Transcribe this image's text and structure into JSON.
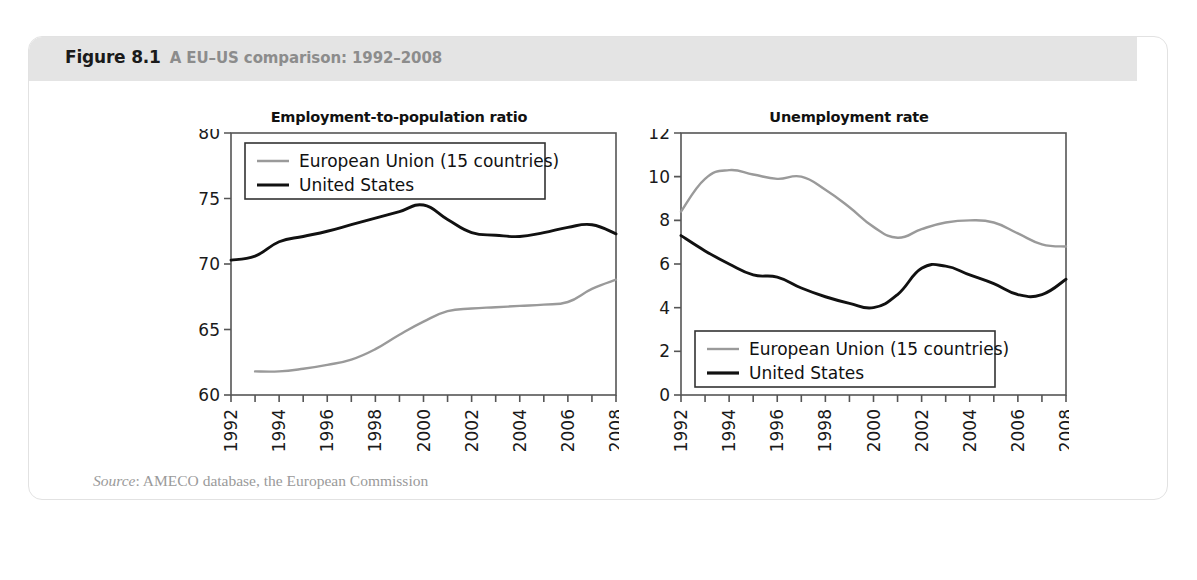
{
  "figure": {
    "number": "Figure 8.1",
    "title": "A EU–US comparison: 1992–2008",
    "source_prefix": "Source",
    "source_text": ": AMECO database, the European Commission"
  },
  "colors": {
    "eu_line": "#9a9a9a",
    "us_line": "#111111",
    "header_band": "#e4e4e4",
    "card_border": "#e2e2e2",
    "caption_gray": "#8c8c8c",
    "axis": "#555555",
    "source_gray": "#9a9a9a"
  },
  "legend": {
    "eu_label": "European Union (15 countries)",
    "us_label": "United States"
  },
  "chart_data": [
    {
      "type": "line",
      "title": "Employment-to-population ratio",
      "xlabel": "",
      "ylabel": "",
      "xlim": [
        1992,
        2008
      ],
      "ylim": [
        60,
        80
      ],
      "yticks": [
        60,
        65,
        70,
        75,
        80
      ],
      "ytick_labels": [
        "60",
        "65",
        "70",
        "75",
        "80"
      ],
      "x": [
        1992,
        1993,
        1994,
        1995,
        1996,
        1997,
        1998,
        1999,
        2000,
        2001,
        2002,
        2003,
        2004,
        2005,
        2006,
        2007,
        2008
      ],
      "xtick_labels": [
        "1992",
        "",
        "1994",
        "",
        "1996",
        "",
        "1998",
        "",
        "2000",
        "",
        "2002",
        "",
        "2004",
        "",
        "2006",
        "",
        "2008"
      ],
      "grid": false,
      "legend_position": "top-left",
      "series": [
        {
          "name": "European Union (15 countries)",
          "color": "#9a9a9a",
          "x": [
            1993,
            1994,
            1995,
            1996,
            1997,
            1998,
            1999,
            2000,
            2001,
            2002,
            2003,
            2004,
            2005,
            2006,
            2007,
            2008
          ],
          "values": [
            61.8,
            61.8,
            62.0,
            62.3,
            62.7,
            63.5,
            64.6,
            65.6,
            66.4,
            66.6,
            66.7,
            66.8,
            66.9,
            67.1,
            68.1,
            68.8
          ]
        },
        {
          "name": "United States",
          "color": "#111111",
          "x": [
            1992,
            1993,
            1994,
            1995,
            1996,
            1997,
            1998,
            1999,
            2000,
            2001,
            2002,
            2003,
            2004,
            2005,
            2006,
            2007,
            2008
          ],
          "values": [
            70.3,
            70.6,
            71.7,
            72.1,
            72.5,
            73.0,
            73.5,
            74.0,
            74.5,
            73.4,
            72.4,
            72.2,
            72.1,
            72.4,
            72.8,
            73.0,
            72.3
          ]
        }
      ]
    },
    {
      "type": "line",
      "title": "Unemployment rate",
      "xlabel": "",
      "ylabel": "",
      "xlim": [
        1992,
        2008
      ],
      "ylim": [
        0,
        12
      ],
      "yticks": [
        0,
        2,
        4,
        6,
        8,
        10,
        12
      ],
      "ytick_labels": [
        "0",
        "2",
        "4",
        "6",
        "8",
        "10",
        "12"
      ],
      "x": [
        1992,
        1993,
        1994,
        1995,
        1996,
        1997,
        1998,
        1999,
        2000,
        2001,
        2002,
        2003,
        2004,
        2005,
        2006,
        2007,
        2008
      ],
      "xtick_labels": [
        "1992",
        "",
        "1994",
        "",
        "1996",
        "",
        "1998",
        "",
        "2000",
        "",
        "2002",
        "",
        "2004",
        "",
        "2006",
        "",
        "2008"
      ],
      "grid": false,
      "legend_position": "bottom-left",
      "series": [
        {
          "name": "European Union (15 countries)",
          "color": "#9a9a9a",
          "x": [
            1992,
            1993,
            1994,
            1995,
            1996,
            1997,
            1998,
            1999,
            2000,
            2001,
            2002,
            2003,
            2004,
            2005,
            2006,
            2007,
            2008
          ],
          "values": [
            8.4,
            9.9,
            10.3,
            10.1,
            9.9,
            10.0,
            9.4,
            8.6,
            7.7,
            7.2,
            7.6,
            7.9,
            8.0,
            7.9,
            7.4,
            6.9,
            6.8
          ]
        },
        {
          "name": "United States",
          "color": "#111111",
          "x": [
            1992,
            1993,
            1994,
            1995,
            1996,
            1997,
            1998,
            1999,
            2000,
            2001,
            2002,
            2003,
            2004,
            2005,
            2006,
            2007,
            2008
          ],
          "values": [
            7.3,
            6.6,
            6.0,
            5.5,
            5.4,
            4.9,
            4.5,
            4.2,
            4.0,
            4.6,
            5.8,
            5.9,
            5.5,
            5.1,
            4.6,
            4.6,
            5.3
          ]
        }
      ]
    }
  ]
}
